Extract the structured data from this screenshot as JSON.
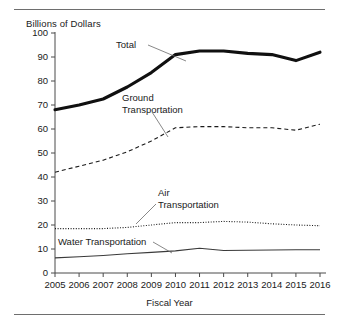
{
  "figure": {
    "y_axis_title": "Billions of Dollars",
    "x_axis_title": "Fiscal Year",
    "top_rule": "horizontal-rule",
    "bottom_rule": "horizontal-rule"
  },
  "annotations": [
    {
      "id": "total",
      "label": "Total",
      "lines": [
        "Total"
      ]
    },
    {
      "id": "ground",
      "label": "Ground Transportation",
      "lines": [
        "Ground",
        "Transportation"
      ]
    },
    {
      "id": "air",
      "label": "Air Transportation",
      "lines": [
        "Air",
        "Transportation"
      ]
    },
    {
      "id": "water",
      "label": "Water Transportation",
      "lines": [
        "Water Transportation"
      ]
    }
  ],
  "chart_data": {
    "type": "line",
    "title": "",
    "subtitle": "",
    "xlabel": "Fiscal Year",
    "ylabel": "Billions of Dollars",
    "x": [
      2005,
      2006,
      2007,
      2008,
      2009,
      2010,
      2011,
      2012,
      2013,
      2014,
      2015,
      2016
    ],
    "categories": [
      "2005",
      "2006",
      "2007",
      "2008",
      "2009",
      "2010",
      "2011",
      "2012",
      "2013",
      "2014",
      "2015",
      "2016"
    ],
    "xlim": [
      2005,
      2016
    ],
    "ylim": [
      0,
      100
    ],
    "yticks": [
      0,
      10,
      20,
      30,
      40,
      50,
      60,
      70,
      80,
      90,
      100
    ],
    "ytick_labels": [
      "0",
      "10",
      "20",
      "30",
      "40",
      "50",
      "60",
      "70",
      "80",
      "90",
      "100"
    ],
    "grid": false,
    "legend": "inline-annotations",
    "series": [
      {
        "name": "Total",
        "style": "solid-thick",
        "color": "#101010",
        "values": [
          68,
          70,
          72.5,
          77.5,
          83.5,
          91,
          92.5,
          92.5,
          91.5,
          91,
          88.5,
          92
        ]
      },
      {
        "name": "Ground Transportation",
        "style": "dashed",
        "color": "#1a1a1a",
        "values": [
          42,
          44.5,
          47,
          50.5,
          55,
          60.5,
          61,
          61,
          60.5,
          60.5,
          59.5,
          62
        ]
      },
      {
        "name": "Air Transportation",
        "style": "dotted",
        "color": "#1a1a1a",
        "values": [
          18.5,
          18.5,
          18.5,
          19,
          20,
          21,
          21,
          21.5,
          21.2,
          20.5,
          20,
          19.7
        ]
      },
      {
        "name": "Water Transportation",
        "style": "solid-thin",
        "color": "#3a3a3a",
        "values": [
          6.3,
          6.8,
          7.3,
          8,
          8.6,
          9.2,
          10.3,
          9.4,
          9.5,
          9.6,
          9.7,
          9.7
        ]
      }
    ]
  }
}
